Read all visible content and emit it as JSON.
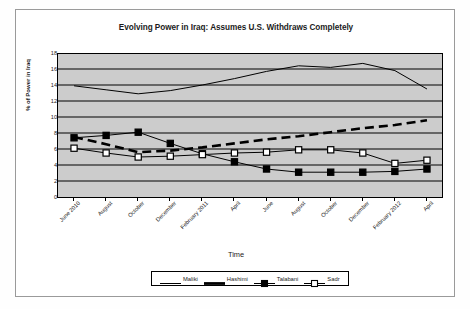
{
  "chart_data": {
    "type": "line",
    "title": "Evolving Power in Iraq: Assumes U.S. Withdraws Completely",
    "xlabel": "Time",
    "ylabel": "% of Power in Iraq",
    "ylim": [
      0,
      18
    ],
    "ytick_step": 2,
    "yticks": [
      0,
      2,
      4,
      6,
      8,
      10,
      12,
      14,
      16,
      18
    ],
    "grid": true,
    "grid_axis": "y",
    "plot_background": "#cccccc",
    "legend_position": "bottom",
    "categories": [
      "June 2010",
      "August",
      "October",
      "December",
      "February 2011",
      "April",
      "June",
      "August",
      "October",
      "December",
      "February 2012",
      "April"
    ],
    "series": [
      {
        "name": "Maliki",
        "style": "thin-solid-line",
        "marker": "none",
        "color": "#000000",
        "values": [
          13.9,
          13.4,
          12.9,
          13.3,
          14.0,
          14.8,
          15.7,
          16.4,
          16.2,
          16.7,
          15.8,
          13.5
        ]
      },
      {
        "name": "Hashimi",
        "style": "thick-dashed-line",
        "marker": "none",
        "color": "#000000",
        "values": [
          7.5,
          6.6,
          5.6,
          5.8,
          6.2,
          6.7,
          7.2,
          7.6,
          8.1,
          8.6,
          9.0,
          9.6
        ]
      },
      {
        "name": "Talabani",
        "style": "thin-solid-line",
        "marker": "filled-square",
        "color": "#000000",
        "values": [
          7.4,
          7.7,
          8.1,
          6.7,
          5.4,
          4.4,
          3.5,
          3.1,
          3.1,
          3.1,
          3.2,
          3.5
        ]
      },
      {
        "name": "Sadr",
        "style": "thin-solid-line",
        "marker": "open-square",
        "color": "#000000",
        "values": [
          6.1,
          5.5,
          5.0,
          5.1,
          5.3,
          5.5,
          5.6,
          5.9,
          5.9,
          5.5,
          4.2,
          4.6
        ]
      }
    ]
  }
}
